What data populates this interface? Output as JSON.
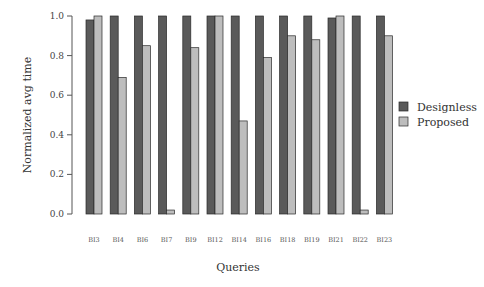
{
  "chart_data": {
    "type": "bar",
    "title": "",
    "xlabel": "Queries",
    "ylabel": "Normalized avg time",
    "ylim": [
      0,
      1.0
    ],
    "yticks": [
      "0.0",
      "0.2",
      "0.4",
      "0.6",
      "0.8",
      "1.0"
    ],
    "grid": false,
    "legend_position": "right",
    "categories": [
      "BI3",
      "BI4",
      "BI6",
      "BI7",
      "BI9",
      "BI12",
      "BI14",
      "BI16",
      "BI18",
      "BI19",
      "BI21",
      "BI22",
      "BI23"
    ],
    "series": [
      {
        "name": "Designless",
        "color": "#5a5a5a",
        "values": [
          0.98,
          1.0,
          1.0,
          1.0,
          1.0,
          1.0,
          1.0,
          1.0,
          1.0,
          1.0,
          0.99,
          1.0,
          1.0
        ]
      },
      {
        "name": "Proposed",
        "color": "#bdbdbd",
        "values": [
          1.0,
          0.69,
          0.85,
          0.02,
          0.84,
          1.0,
          0.47,
          0.79,
          0.9,
          0.88,
          1.0,
          0.02,
          0.9
        ]
      }
    ]
  }
}
